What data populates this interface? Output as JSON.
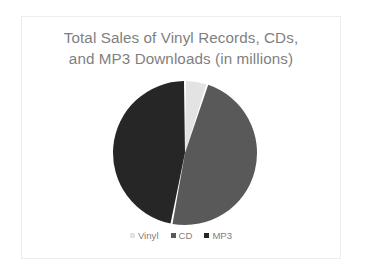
{
  "slide": {
    "background_color": "#ffffff",
    "border_color": "#ededed"
  },
  "chart": {
    "title": "Total Sales of Vinyl Records, CDs,\nand MP3 Downloads (in millions)",
    "title_color": "#7f7f7f",
    "legend_position": "bottom"
  },
  "legend": {
    "items": [
      {
        "label": "Vinyl",
        "color": "#e3e3e3"
      },
      {
        "label": "CD",
        "color": "#595959"
      },
      {
        "label": "MP3",
        "color": "#262626"
      }
    ]
  },
  "chart_data": {
    "type": "pie",
    "title": "Total Sales of Vinyl Records, CDs, and MP3 Downloads (in millions)",
    "xlabel": "",
    "ylabel": "",
    "categories": [
      "Vinyl",
      "CD",
      "MP3"
    ],
    "values": [
      5,
      48,
      47
    ],
    "units": "millions",
    "colors": [
      "#e3e3e3",
      "#595959",
      "#262626"
    ],
    "slice_gap_color": "#ffffff",
    "legend": [
      "Vinyl",
      "CD",
      "MP3"
    ],
    "legend_position": "bottom",
    "grid": false,
    "start_angle_deg": 0,
    "direction": "clockwise"
  }
}
